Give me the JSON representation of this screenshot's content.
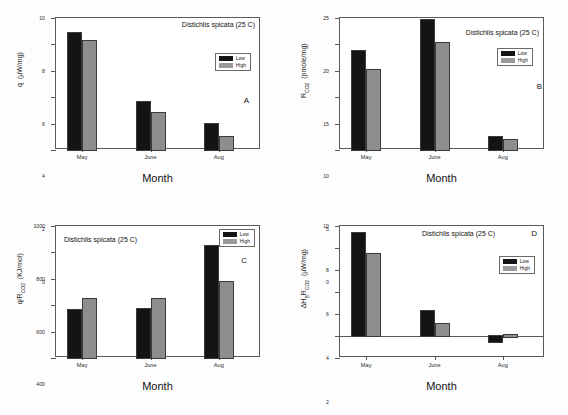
{
  "figure": {
    "species_label": "Distichlis spicata (25 C)",
    "xtitle": "Month",
    "legend": {
      "low": "Low",
      "high": "High"
    },
    "colors": {
      "low": "#141414",
      "high": "#8e8e8e",
      "axis": "#5a5a5a"
    }
  },
  "chart_data": [
    {
      "type": "bar",
      "panel": "A",
      "title": "Distichlis spicata (25 C)",
      "xlabel": "Month",
      "ylabel": "q  (μW/mg)",
      "categories": [
        "May",
        "June",
        "Aug"
      ],
      "series": [
        {
          "name": "Low",
          "values": [
            8.9,
            3.6,
            2.0
          ]
        },
        {
          "name": "High",
          "values": [
            8.25,
            2.8,
            1.0
          ]
        }
      ],
      "ylim": [
        0,
        10
      ],
      "yticks": [
        0,
        2,
        4,
        6,
        8,
        10
      ],
      "grid": false,
      "legend_position": "upper-right"
    },
    {
      "type": "bar",
      "panel": "B",
      "title": "Distichlis spicata (25 C)",
      "xlabel": "Month",
      "ylabel": "R_CO2  (pmole/mg)",
      "categories": [
        "May",
        "June",
        "Aug"
      ],
      "series": [
        {
          "name": "Low",
          "values": [
            18.7,
            24.6,
            2.5
          ]
        },
        {
          "name": "High",
          "values": [
            15.2,
            20.2,
            1.8
          ]
        }
      ],
      "ylim": [
        0,
        25
      ],
      "yticks": [
        0,
        5,
        10,
        15,
        20,
        25
      ],
      "grid": false,
      "legend_position": "upper-right"
    },
    {
      "type": "bar",
      "panel": "C",
      "title": "Distichlis spicata (25 C)",
      "xlabel": "Month",
      "ylabel": "q/R_CO2  (KJ/mol)",
      "categories": [
        "May",
        "June",
        "Aug"
      ],
      "series": [
        {
          "name": "Low",
          "values": [
            365,
            370,
            845
          ]
        },
        {
          "name": "High",
          "values": [
            445,
            450,
            575
          ]
        }
      ],
      "ylim": [
        0,
        1000
      ],
      "yticks": [
        0,
        200,
        400,
        600,
        800,
        1000
      ],
      "grid": false,
      "legend_position": "upper-right"
    },
    {
      "type": "bar",
      "panel": "D",
      "title": "Distichlis spicata (25 C)",
      "xlabel": "Month",
      "ylabel": "ΔH_B R_CO2  (μW/mg)",
      "categories": [
        "May",
        "June",
        "Aug"
      ],
      "series": [
        {
          "name": "Low",
          "values": [
            9.4,
            2.3,
            -0.5
          ]
        },
        {
          "name": "High",
          "values": [
            7.5,
            1.05,
            0.1
          ]
        }
      ],
      "ylim": [
        -2,
        10
      ],
      "yticks": [
        -2,
        0,
        2,
        4,
        6,
        8,
        10
      ],
      "grid": false,
      "legend_position": "upper-right"
    }
  ],
  "panels": {
    "A": {
      "letter": "A",
      "ytick_labels": [
        "0",
        "2",
        "4",
        "6",
        "8",
        "10"
      ]
    },
    "B": {
      "letter": "B",
      "ytick_labels": [
        "0",
        "5",
        "10",
        "15",
        "20",
        "25"
      ]
    },
    "C": {
      "letter": "C",
      "ytick_labels": [
        "0",
        "200",
        "400",
        "600",
        "800",
        "1000"
      ]
    },
    "D": {
      "letter": "D",
      "ytick_labels": [
        "-2",
        "0",
        "2",
        "4",
        "6",
        "8",
        "10"
      ]
    }
  }
}
